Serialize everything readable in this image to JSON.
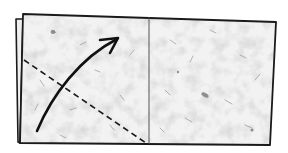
{
  "diagram": {
    "type": "origami-fold-instruction",
    "colors": {
      "background": "#ffffff",
      "paper": "#ededed",
      "paper_light": "#f6f6f6",
      "outline": "#1a1a1a",
      "crease": "#555555",
      "fleck": "#9a9a9a"
    },
    "sheet": {
      "front": {
        "points": "23,14 276,22 270,145 20,143"
      },
      "back_edge": {
        "points": "23,19 16,19 18,142 20,143"
      }
    },
    "center_crease": {
      "x1": 149,
      "y1": 17,
      "x2": 149,
      "y2": 144
    },
    "fold_line": {
      "style": "dashed",
      "x1": 24,
      "y1": 60,
      "x2": 146,
      "y2": 143
    },
    "arrow": {
      "path": "M37,131 C52,95 80,58 117,39",
      "head": "M100,40 L118,38 L110,53"
    }
  }
}
